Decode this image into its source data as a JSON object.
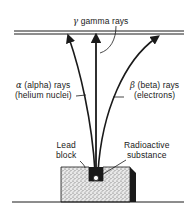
{
  "diagram": {
    "type": "radiation-deflection",
    "labels": {
      "gamma": {
        "symbol": "γ",
        "text": "gamma rays"
      },
      "alpha": {
        "symbol": "α",
        "line1": "(alpha) rays",
        "line2": "(helium nuclei)"
      },
      "beta": {
        "symbol": "β",
        "line1": "(beta) rays",
        "line2": "(electrons)"
      },
      "lead_block": {
        "line1": "Lead",
        "line2": "block"
      },
      "source": {
        "line1": "Radioactive",
        "line2": "substance"
      }
    },
    "colors": {
      "ink": "#1a1a1a",
      "background": "#ffffff",
      "stipple": "#8a8a8a"
    }
  }
}
